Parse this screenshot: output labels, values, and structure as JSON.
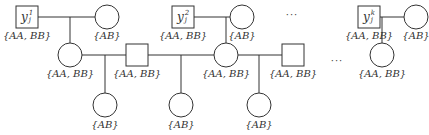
{
  "diagram": {
    "type": "pedigree",
    "stroke_color": "#333333",
    "founders": [
      {
        "id": "y1",
        "shape": "square",
        "symbol": "y",
        "sup": "1",
        "sub": "j",
        "genotype": "{AA, BB}"
      },
      {
        "id": "y2",
        "shape": "square",
        "symbol": "y",
        "sup": "2",
        "sub": "j",
        "genotype": "{AA, BB}"
      },
      {
        "id": "yk",
        "shape": "square",
        "symbol": "y",
        "sup": "k",
        "sub": "j",
        "genotype": "{AA, BB}"
      }
    ],
    "mates": [
      {
        "id": "m1",
        "shape": "circle",
        "genotype": "{AB}"
      },
      {
        "id": "m2",
        "shape": "circle",
        "genotype": "{AB}"
      },
      {
        "id": "mk",
        "shape": "circle",
        "genotype": "{AB}"
      }
    ],
    "second_generation": [
      {
        "id": "c1",
        "shape": "circle",
        "genotype": "{AA, BB}"
      },
      {
        "id": "s1",
        "shape": "square",
        "genotype": "{AA, BB}"
      },
      {
        "id": "c2",
        "shape": "circle",
        "genotype": "{AA, BB}"
      },
      {
        "id": "s2",
        "shape": "square",
        "genotype": "{AA, BB}"
      },
      {
        "id": "ck",
        "shape": "circle",
        "genotype": "{AA, BB}"
      }
    ],
    "third_generation": [
      {
        "id": "g1",
        "shape": "circle",
        "genotype": "{AB}"
      },
      {
        "id": "g2",
        "shape": "circle",
        "genotype": "{AB}"
      },
      {
        "id": "g3",
        "shape": "circle",
        "genotype": "{AB}"
      }
    ],
    "ellipsis": [
      "···",
      "···"
    ]
  }
}
